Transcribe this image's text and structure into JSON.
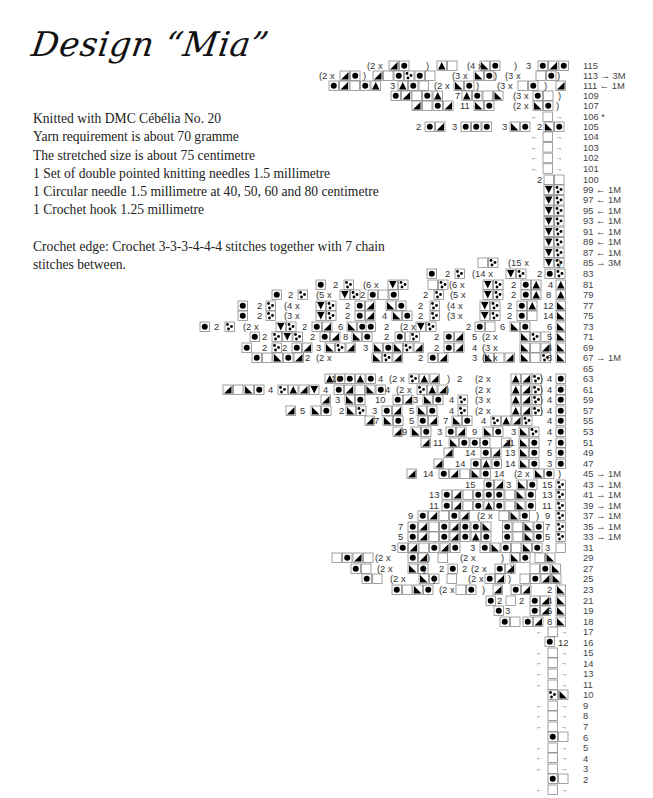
{
  "title": "Design “Mia”",
  "info": {
    "lines": [
      "Knitted with DMC Cébélia No. 20",
      "Yarn requirement is about 70 gramme",
      "The stretched size is about 75 centimetre",
      "1 Set of double pointed knitting needles 1.5 millimetre",
      "1 Circular needle 1.5 millimetre at 40, 50, 60 and 80 centimetre",
      "1 Crochet hook 1.25 millimetre"
    ],
    "crochet_edge": [
      "Crochet edge: Crochet 3-3-3-4-4-4 stitches together with 7 chain",
      "stitches between."
    ]
  },
  "chart": {
    "row_labels": [
      {
        "row": "115",
        "note": "",
        "y": 66
      },
      {
        "row": "113",
        "note": "→ 3M",
        "y": 76
      },
      {
        "row": "111",
        "note": "← 1M",
        "y": 86
      },
      {
        "row": "109",
        "note": "",
        "y": 96
      },
      {
        "row": "107",
        "note": "",
        "y": 106
      },
      {
        "row": "106",
        "note": "*",
        "y": 117
      },
      {
        "row": "105",
        "note": "",
        "y": 127
      },
      {
        "row": "104",
        "note": "",
        "y": 137
      },
      {
        "row": "103",
        "note": "",
        "y": 148
      },
      {
        "row": "102",
        "note": "",
        "y": 158
      },
      {
        "row": "101",
        "note": "",
        "y": 169
      },
      {
        "row": "100",
        "note": "",
        "y": 180
      },
      {
        "row": "99",
        "note": "← 1M",
        "y": 190
      },
      {
        "row": "97",
        "note": "← 1M",
        "y": 200
      },
      {
        "row": "95",
        "note": "← 1M",
        "y": 211
      },
      {
        "row": "93",
        "note": "← 1M",
        "y": 221
      },
      {
        "row": "91",
        "note": "← 1M",
        "y": 232
      },
      {
        "row": "89",
        "note": "← 1M",
        "y": 242
      },
      {
        "row": "87",
        "note": "← 1M",
        "y": 253
      },
      {
        "row": "85",
        "note": "→ 3M",
        "y": 263
      },
      {
        "row": "83",
        "note": "",
        "y": 274
      },
      {
        "row": "81",
        "note": "",
        "y": 285
      },
      {
        "row": "79",
        "note": "",
        "y": 295
      },
      {
        "row": "77",
        "note": "",
        "y": 306
      },
      {
        "row": "75",
        "note": "",
        "y": 316
      },
      {
        "row": "73",
        "note": "",
        "y": 327
      },
      {
        "row": "71",
        "note": "",
        "y": 337
      },
      {
        "row": "69",
        "note": "",
        "y": 348
      },
      {
        "row": "67",
        "note": "→ 1M",
        "y": 358
      },
      {
        "row": "65",
        "note": "",
        "y": 369
      },
      {
        "row": "63",
        "note": "",
        "y": 379
      },
      {
        "row": "61",
        "note": "",
        "y": 390
      },
      {
        "row": "59",
        "note": "",
        "y": 400
      },
      {
        "row": "57",
        "note": "",
        "y": 411
      },
      {
        "row": "55",
        "note": "",
        "y": 421
      },
      {
        "row": "53",
        "note": "",
        "y": 432
      },
      {
        "row": "51",
        "note": "",
        "y": 443
      },
      {
        "row": "49",
        "note": "",
        "y": 453
      },
      {
        "row": "47",
        "note": "",
        "y": 464
      },
      {
        "row": "45",
        "note": "→ 1M",
        "y": 474
      },
      {
        "row": "43",
        "note": "→ 1M",
        "y": 485
      },
      {
        "row": "41",
        "note": "→ 1M",
        "y": 495
      },
      {
        "row": "39",
        "note": "→ 1M",
        "y": 506
      },
      {
        "row": "37",
        "note": "→ 1M",
        "y": 516
      },
      {
        "row": "35",
        "note": "→ 1M",
        "y": 527
      },
      {
        "row": "33",
        "note": "→ 1M",
        "y": 537
      },
      {
        "row": "31",
        "note": "",
        "y": 548
      },
      {
        "row": "29",
        "note": "",
        "y": 558
      },
      {
        "row": "27",
        "note": "",
        "y": 569
      },
      {
        "row": "25",
        "note": "",
        "y": 579
      },
      {
        "row": "23",
        "note": "",
        "y": 590
      },
      {
        "row": "21",
        "note": "",
        "y": 601
      },
      {
        "row": "19",
        "note": "",
        "y": 611
      },
      {
        "row": "18",
        "note": "",
        "y": 622
      },
      {
        "row": "17",
        "note": "",
        "y": 632
      },
      {
        "row": "16",
        "note": "",
        "y": 643
      },
      {
        "row": "15",
        "note": "",
        "y": 653
      },
      {
        "row": "14",
        "note": "",
        "y": 664
      },
      {
        "row": "13",
        "note": "",
        "y": 674
      },
      {
        "row": "11",
        "note": "",
        "y": 685
      },
      {
        "row": "10",
        "note": "",
        "y": 695
      },
      {
        "row": "9",
        "note": "",
        "y": 706
      },
      {
        "row": "8",
        "note": "",
        "y": 716
      },
      {
        "row": "7",
        "note": "",
        "y": 727
      },
      {
        "row": "6",
        "note": "",
        "y": 738
      },
      {
        "row": "5",
        "note": "",
        "y": 748
      },
      {
        "row": "4",
        "note": "",
        "y": 759
      },
      {
        "row": "3",
        "note": "",
        "y": 769
      },
      {
        "row": "2",
        "note": "",
        "y": 780
      }
    ],
    "annotations": [
      {
        "text": "(2  x",
        "x": 367,
        "y": 66
      },
      {
        "text": ")",
        "x": 426,
        "y": 66
      },
      {
        "text": "(4  x",
        "x": 467,
        "y": 66
      },
      {
        "text": ")",
        "x": 514,
        "y": 66
      },
      {
        "text": "3",
        "x": 526,
        "y": 66
      },
      {
        "text": "(2  x",
        "x": 319,
        "y": 76
      },
      {
        "text": ")",
        "x": 363,
        "y": 76
      },
      {
        "text": "(3  x",
        "x": 452,
        "y": 76
      },
      {
        "text": ")",
        "x": 494,
        "y": 76
      },
      {
        "text": "(3  x",
        "x": 505,
        "y": 76
      },
      {
        "text": ")",
        "x": 557,
        "y": 76
      },
      {
        "text": "3",
        "x": 390,
        "y": 86
      },
      {
        "text": "(2  x",
        "x": 434,
        "y": 86
      },
      {
        "text": ")",
        "x": 476,
        "y": 86
      },
      {
        "text": "(3  x",
        "x": 497,
        "y": 86
      },
      {
        "text": ")",
        "x": 544,
        "y": 86
      },
      {
        "text": "7",
        "x": 455,
        "y": 96
      },
      {
        "text": "(3  x",
        "x": 513,
        "y": 96
      },
      {
        "text": ")",
        "x": 558,
        "y": 96
      },
      {
        "text": "11",
        "x": 460,
        "y": 106
      },
      {
        "text": "(2  x",
        "x": 513,
        "y": 106
      },
      {
        "text": ")",
        "x": 556,
        "y": 106
      },
      {
        "text": "2",
        "x": 416,
        "y": 127
      },
      {
        "text": "3",
        "x": 452,
        "y": 127
      },
      {
        "text": "3",
        "x": 502,
        "y": 127
      },
      {
        "text": "2",
        "x": 537,
        "y": 127
      },
      {
        "text": "2",
        "x": 537,
        "y": 180
      },
      {
        "text": "(15  x",
        "x": 508,
        "y": 263
      },
      {
        "text": ")",
        "x": 558,
        "y": 263
      },
      {
        "text": "2",
        "x": 445,
        "y": 274
      },
      {
        "text": "(14  x",
        "x": 472,
        "y": 274
      },
      {
        "text": "2",
        "x": 537,
        "y": 274
      },
      {
        "text": "2",
        "x": 333,
        "y": 285
      },
      {
        "text": "(6  x",
        "x": 363,
        "y": 285
      },
      {
        "text": "(6  x",
        "x": 449,
        "y": 285
      },
      {
        "text": "2",
        "x": 511,
        "y": 285
      },
      {
        "text": "4",
        "x": 548,
        "y": 285
      },
      {
        "text": "2",
        "x": 288,
        "y": 295
      },
      {
        "text": "(5  x",
        "x": 316,
        "y": 295
      },
      {
        "text": "2",
        "x": 360,
        "y": 295
      },
      {
        "text": "2",
        "x": 423,
        "y": 295
      },
      {
        "text": "(5  x",
        "x": 450,
        "y": 295
      },
      {
        "text": "2",
        "x": 511,
        "y": 295
      },
      {
        "text": "8",
        "x": 546,
        "y": 295
      },
      {
        "text": "2",
        "x": 257,
        "y": 306
      },
      {
        "text": "(4  x",
        "x": 284,
        "y": 306
      },
      {
        "text": "2",
        "x": 345,
        "y": 306
      },
      {
        "text": "2",
        "x": 418,
        "y": 306
      },
      {
        "text": "(4  x",
        "x": 447,
        "y": 306
      },
      {
        "text": "2",
        "x": 507,
        "y": 306
      },
      {
        "text": "12",
        "x": 543,
        "y": 306
      },
      {
        "text": "2",
        "x": 257,
        "y": 316
      },
      {
        "text": "(3  x",
        "x": 284,
        "y": 316
      },
      {
        "text": "2",
        "x": 345,
        "y": 316
      },
      {
        "text": "4",
        "x": 382,
        "y": 316
      },
      {
        "text": "2",
        "x": 418,
        "y": 316
      },
      {
        "text": "(3  x",
        "x": 447,
        "y": 316
      },
      {
        "text": "2",
        "x": 507,
        "y": 316
      },
      {
        "text": "14",
        "x": 543,
        "y": 316
      },
      {
        "text": "2",
        "x": 214,
        "y": 327
      },
      {
        "text": "(2  x",
        "x": 243,
        "y": 327
      },
      {
        "text": "2",
        "x": 302,
        "y": 327
      },
      {
        "text": "6",
        "x": 338,
        "y": 327
      },
      {
        "text": "2",
        "x": 384,
        "y": 327
      },
      {
        "text": "(2  x",
        "x": 400,
        "y": 327
      },
      {
        "text": "2",
        "x": 466,
        "y": 327
      },
      {
        "text": "6",
        "x": 500,
        "y": 327
      },
      {
        "text": "6",
        "x": 547,
        "y": 327
      },
      {
        "text": "2",
        "x": 262,
        "y": 337
      },
      {
        "text": "2",
        "x": 310,
        "y": 337
      },
      {
        "text": "8",
        "x": 343,
        "y": 337
      },
      {
        "text": "2",
        "x": 384,
        "y": 337
      },
      {
        "text": "2",
        "x": 434,
        "y": 337
      },
      {
        "text": "5",
        "x": 472,
        "y": 337
      },
      {
        "text": "(2  x",
        "x": 482,
        "y": 337
      },
      {
        "text": "5",
        "x": 547,
        "y": 337
      },
      {
        "text": "2",
        "x": 262,
        "y": 348
      },
      {
        "text": "2",
        "x": 282,
        "y": 348
      },
      {
        "text": "3",
        "x": 316,
        "y": 348
      },
      {
        "text": "3",
        "x": 363,
        "y": 348
      },
      {
        "text": "2",
        "x": 434,
        "y": 348
      },
      {
        "text": "4",
        "x": 472,
        "y": 348
      },
      {
        "text": "(3  x",
        "x": 482,
        "y": 348
      },
      {
        "text": "4",
        "x": 547,
        "y": 348
      },
      {
        "text": "2",
        "x": 305,
        "y": 358
      },
      {
        "text": "(2  x",
        "x": 316,
        "y": 358
      },
      {
        "text": "2",
        "x": 418,
        "y": 358
      },
      {
        "text": "3",
        "x": 472,
        "y": 358
      },
      {
        "text": "(4  x",
        "x": 482,
        "y": 358
      },
      {
        "text": "3",
        "x": 547,
        "y": 358
      },
      {
        "text": "16",
        "x": 331,
        "y": 379
      },
      {
        "text": "4",
        "x": 378,
        "y": 379
      },
      {
        "text": "(2  x",
        "x": 389,
        "y": 379
      },
      {
        "text": ")",
        "x": 447,
        "y": 379
      },
      {
        "text": "2",
        "x": 457,
        "y": 379
      },
      {
        "text": "(2  x",
        "x": 475,
        "y": 379
      },
      {
        "text": ")",
        "x": 540,
        "y": 379
      },
      {
        "text": "4",
        "x": 547,
        "y": 379
      },
      {
        "text": "4",
        "x": 268,
        "y": 390
      },
      {
        "text": "4",
        "x": 323,
        "y": 390
      },
      {
        "text": "4",
        "x": 385,
        "y": 390
      },
      {
        "text": "(2  x",
        "x": 396,
        "y": 390
      },
      {
        "text": ")",
        "x": 446,
        "y": 390
      },
      {
        "text": "(2  x",
        "x": 475,
        "y": 390
      },
      {
        "text": ")",
        "x": 540,
        "y": 390
      },
      {
        "text": "4",
        "x": 547,
        "y": 390
      },
      {
        "text": "3",
        "x": 335,
        "y": 400
      },
      {
        "text": "10",
        "x": 375,
        "y": 400
      },
      {
        "text": "3",
        "x": 413,
        "y": 400
      },
      {
        "text": "4",
        "x": 449,
        "y": 400
      },
      {
        "text": "(3  x",
        "x": 475,
        "y": 400
      },
      {
        "text": ")",
        "x": 540,
        "y": 400
      },
      {
        "text": "4",
        "x": 547,
        "y": 400
      },
      {
        "text": "5",
        "x": 300,
        "y": 411
      },
      {
        "text": "2",
        "x": 339,
        "y": 411
      },
      {
        "text": "3",
        "x": 372,
        "y": 411
      },
      {
        "text": "5",
        "x": 409,
        "y": 411
      },
      {
        "text": "4",
        "x": 449,
        "y": 411
      },
      {
        "text": "(2  x",
        "x": 475,
        "y": 411
      },
      {
        "text": ")",
        "x": 540,
        "y": 411
      },
      {
        "text": "4",
        "x": 547,
        "y": 411
      },
      {
        "text": "7",
        "x": 374,
        "y": 421
      },
      {
        "text": "5",
        "x": 409,
        "y": 421
      },
      {
        "text": "7",
        "x": 443,
        "y": 421
      },
      {
        "text": "4",
        "x": 481,
        "y": 421
      },
      {
        "text": "4",
        "x": 547,
        "y": 421
      },
      {
        "text": "9",
        "x": 402,
        "y": 432
      },
      {
        "text": "3",
        "x": 437,
        "y": 432
      },
      {
        "text": "9",
        "x": 472,
        "y": 432
      },
      {
        "text": "3",
        "x": 511,
        "y": 432
      },
      {
        "text": "4",
        "x": 547,
        "y": 432
      },
      {
        "text": "11",
        "x": 433,
        "y": 443
      },
      {
        "text": "11",
        "x": 505,
        "y": 443
      },
      {
        "text": "7",
        "x": 547,
        "y": 443
      },
      {
        "text": "14",
        "x": 465,
        "y": 453
      },
      {
        "text": "13",
        "x": 505,
        "y": 453
      },
      {
        "text": "5",
        "x": 547,
        "y": 453
      },
      {
        "text": "14",
        "x": 455,
        "y": 464
      },
      {
        "text": "14",
        "x": 505,
        "y": 464
      },
      {
        "text": "3",
        "x": 547,
        "y": 464
      },
      {
        "text": "14",
        "x": 423,
        "y": 474
      },
      {
        "text": "14",
        "x": 494,
        "y": 474
      },
      {
        "text": "(2  x",
        "x": 514,
        "y": 474
      },
      {
        "text": ")",
        "x": 558,
        "y": 474
      },
      {
        "text": "15",
        "x": 465,
        "y": 485
      },
      {
        "text": "3",
        "x": 506,
        "y": 485
      },
      {
        "text": "15",
        "x": 542,
        "y": 485
      },
      {
        "text": "13",
        "x": 429,
        "y": 495
      },
      {
        "text": "13",
        "x": 542,
        "y": 495
      },
      {
        "text": "11",
        "x": 429,
        "y": 506
      },
      {
        "text": "11",
        "x": 542,
        "y": 506
      },
      {
        "text": "9",
        "x": 408,
        "y": 516
      },
      {
        "text": "(2  x",
        "x": 477,
        "y": 516
      },
      {
        "text": ")",
        "x": 536,
        "y": 516
      },
      {
        "text": "9",
        "x": 545,
        "y": 516
      },
      {
        "text": "7",
        "x": 398,
        "y": 527
      },
      {
        "text": "7",
        "x": 545,
        "y": 527
      },
      {
        "text": "5",
        "x": 398,
        "y": 537
      },
      {
        "text": "5",
        "x": 545,
        "y": 537
      },
      {
        "text": "3",
        "x": 391,
        "y": 548
      },
      {
        "text": "3",
        "x": 470,
        "y": 548
      },
      {
        "text": "3",
        "x": 545,
        "y": 548
      },
      {
        "text": "(2  x",
        "x": 375,
        "y": 558
      },
      {
        "text": ")",
        "x": 427,
        "y": 558
      },
      {
        "text": "(2  x",
        "x": 460,
        "y": 558
      },
      {
        "text": ")",
        "x": 501,
        "y": 558
      },
      {
        "text": "(2  x",
        "x": 377,
        "y": 569
      },
      {
        "text": ")",
        "x": 423,
        "y": 569
      },
      {
        "text": "2",
        "x": 439,
        "y": 569
      },
      {
        "text": "2",
        "x": 462,
        "y": 569
      },
      {
        "text": "(2  x",
        "x": 471,
        "y": 569
      },
      {
        "text": ")",
        "x": 510,
        "y": 569
      },
      {
        "text": "(2  x",
        "x": 390,
        "y": 579
      },
      {
        "text": ")",
        "x": 433,
        "y": 579
      },
      {
        "text": "(2  x",
        "x": 468,
        "y": 579
      },
      {
        "text": ")",
        "x": 508,
        "y": 579
      },
      {
        "text": "(2  x",
        "x": 439,
        "y": 590
      },
      {
        "text": ")",
        "x": 482,
        "y": 590
      },
      {
        "text": "2",
        "x": 547,
        "y": 590
      },
      {
        "text": "2",
        "x": 497,
        "y": 601
      },
      {
        "text": "2",
        "x": 519,
        "y": 601
      },
      {
        "text": "4",
        "x": 547,
        "y": 601
      },
      {
        "text": "3",
        "x": 505,
        "y": 611
      },
      {
        "text": "6",
        "x": 547,
        "y": 611
      },
      {
        "text": "8",
        "x": 547,
        "y": 622
      },
      {
        "text": "12",
        "x": 558,
        "y": 643
      }
    ]
  },
  "legend_symbols": {
    "filled_circle": "●",
    "triangle_up": "▲",
    "triangle_down": "▼",
    "half_left": "◣",
    "half_right": "◢",
    "dots": "∴",
    "arrow_left": "←",
    "arrow_right": "→",
    "empty": "□"
  }
}
